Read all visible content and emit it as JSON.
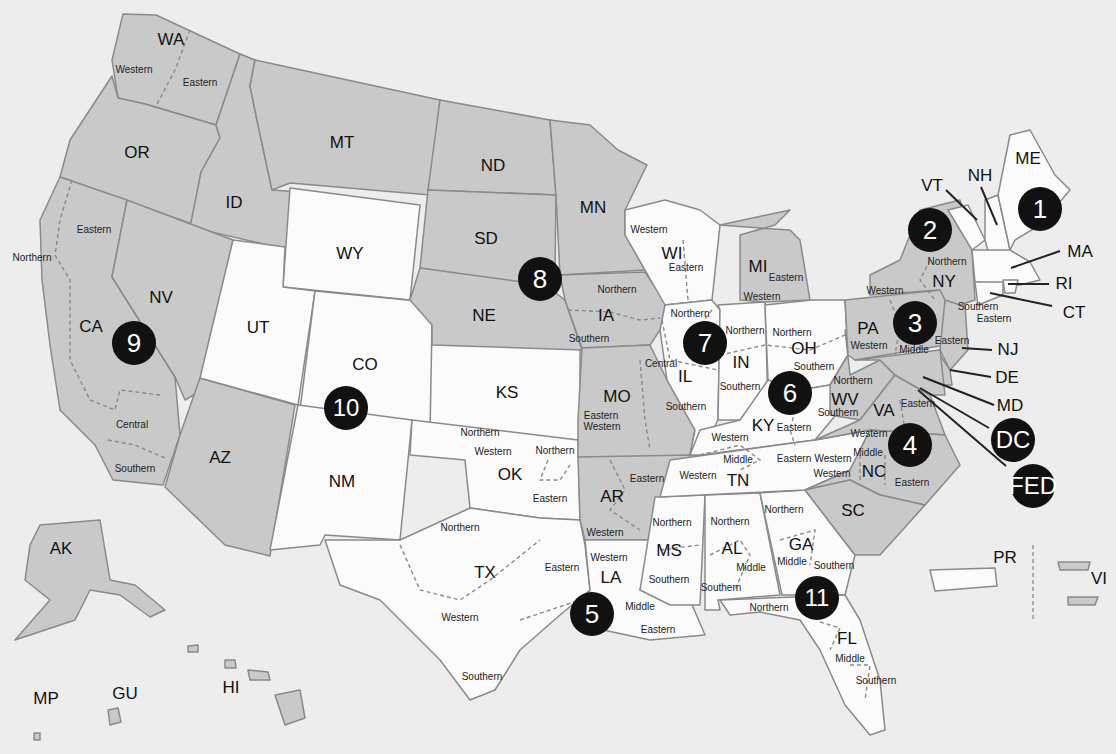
{
  "map": {
    "type": "US federal judicial circuits and districts",
    "colors": {
      "background": "#ededed",
      "gray_circuit": "#c9c9c9",
      "white_circuit": "#fbfbfb",
      "badge": "#111111",
      "border": "#8a8a8a"
    }
  },
  "states": [
    {
      "abbr": "WA",
      "x": 171,
      "y": 40
    },
    {
      "abbr": "OR",
      "x": 137,
      "y": 153
    },
    {
      "abbr": "ID",
      "x": 234,
      "y": 203
    },
    {
      "abbr": "MT",
      "x": 342,
      "y": 143
    },
    {
      "abbr": "WY",
      "x": 350,
      "y": 254
    },
    {
      "abbr": "NV",
      "x": 161,
      "y": 298
    },
    {
      "abbr": "CA",
      "x": 91,
      "y": 327
    },
    {
      "abbr": "UT",
      "x": 258,
      "y": 328
    },
    {
      "abbr": "CO",
      "x": 365,
      "y": 365
    },
    {
      "abbr": "AZ",
      "x": 220,
      "y": 458
    },
    {
      "abbr": "NM",
      "x": 342,
      "y": 482
    },
    {
      "abbr": "ND",
      "x": 493,
      "y": 166
    },
    {
      "abbr": "SD",
      "x": 486,
      "y": 239
    },
    {
      "abbr": "NE",
      "x": 484,
      "y": 316
    },
    {
      "abbr": "MN",
      "x": 593,
      "y": 208
    },
    {
      "abbr": "KS",
      "x": 507,
      "y": 393
    },
    {
      "abbr": "OK",
      "x": 510,
      "y": 475
    },
    {
      "abbr": "TX",
      "x": 485,
      "y": 573
    },
    {
      "abbr": "IA",
      "x": 606,
      "y": 316
    },
    {
      "abbr": "MO",
      "x": 617,
      "y": 397
    },
    {
      "abbr": "AR",
      "x": 612,
      "y": 497
    },
    {
      "abbr": "LA",
      "x": 611,
      "y": 578
    },
    {
      "abbr": "WI",
      "x": 672,
      "y": 254
    },
    {
      "abbr": "MI",
      "x": 758,
      "y": 267
    },
    {
      "abbr": "IL",
      "x": 685,
      "y": 377
    },
    {
      "abbr": "IN",
      "x": 741,
      "y": 363
    },
    {
      "abbr": "OH",
      "x": 804,
      "y": 349
    },
    {
      "abbr": "KY",
      "x": 763,
      "y": 426
    },
    {
      "abbr": "TN",
      "x": 738,
      "y": 481
    },
    {
      "abbr": "MS",
      "x": 669,
      "y": 551
    },
    {
      "abbr": "AL",
      "x": 732,
      "y": 549
    },
    {
      "abbr": "GA",
      "x": 801,
      "y": 545
    },
    {
      "abbr": "FL",
      "x": 847,
      "y": 639
    },
    {
      "abbr": "SC",
      "x": 853,
      "y": 511
    },
    {
      "abbr": "NC",
      "x": 874,
      "y": 472
    },
    {
      "abbr": "VA",
      "x": 884,
      "y": 411
    },
    {
      "abbr": "WV",
      "x": 845,
      "y": 400
    },
    {
      "abbr": "PA",
      "x": 868,
      "y": 329
    },
    {
      "abbr": "NY",
      "x": 944,
      "y": 282
    },
    {
      "abbr": "ME",
      "x": 1028,
      "y": 159
    },
    {
      "abbr": "VT",
      "x": 932,
      "y": 186
    },
    {
      "abbr": "NH",
      "x": 980,
      "y": 176
    },
    {
      "abbr": "MA",
      "x": 1080,
      "y": 252
    },
    {
      "abbr": "RI",
      "x": 1064,
      "y": 284
    },
    {
      "abbr": "CT",
      "x": 1074,
      "y": 313
    },
    {
      "abbr": "NJ",
      "x": 1008,
      "y": 350
    },
    {
      "abbr": "DE",
      "x": 1007,
      "y": 378
    },
    {
      "abbr": "MD",
      "x": 1010,
      "y": 406
    },
    {
      "abbr": "AK",
      "x": 61,
      "y": 549
    },
    {
      "abbr": "HI",
      "x": 231,
      "y": 688
    },
    {
      "abbr": "GU",
      "x": 125,
      "y": 694
    },
    {
      "abbr": "MP",
      "x": 46,
      "y": 699
    },
    {
      "abbr": "PR",
      "x": 1005,
      "y": 558
    },
    {
      "abbr": "VI",
      "x": 1099,
      "y": 579
    }
  ],
  "districts": [
    {
      "name": "Western",
      "x": 134,
      "y": 69
    },
    {
      "name": "Eastern",
      "x": 200,
      "y": 82
    },
    {
      "name": "Eastern",
      "x": 94,
      "y": 229
    },
    {
      "name": "Northern",
      "x": 32,
      "y": 257
    },
    {
      "name": "Central",
      "x": 132,
      "y": 424
    },
    {
      "name": "Southern",
      "x": 135,
      "y": 468
    },
    {
      "name": "Northern",
      "x": 617,
      "y": 289
    },
    {
      "name": "Southern",
      "x": 589,
      "y": 338
    },
    {
      "name": "Western",
      "x": 649,
      "y": 229
    },
    {
      "name": "Eastern",
      "x": 686,
      "y": 267
    },
    {
      "name": "Eastern",
      "x": 786,
      "y": 277
    },
    {
      "name": "Western",
      "x": 762,
      "y": 296
    },
    {
      "name": "Northern",
      "x": 690,
      "y": 313
    },
    {
      "name": "Central",
      "x": 661,
      "y": 363
    },
    {
      "name": "Southern",
      "x": 686,
      "y": 406
    },
    {
      "name": "Northern",
      "x": 745,
      "y": 330
    },
    {
      "name": "Southern",
      "x": 740,
      "y": 386
    },
    {
      "name": "Northern",
      "x": 792,
      "y": 332
    },
    {
      "name": "Southern",
      "x": 814,
      "y": 366
    },
    {
      "name": "Eastern",
      "x": 601,
      "y": 415
    },
    {
      "name": "Western",
      "x": 602,
      "y": 426
    },
    {
      "name": "Western",
      "x": 730,
      "y": 437
    },
    {
      "name": "Eastern",
      "x": 794,
      "y": 427
    },
    {
      "name": "Middle",
      "x": 738,
      "y": 459
    },
    {
      "name": "Eastern",
      "x": 794,
      "y": 458
    },
    {
      "name": "Western",
      "x": 698,
      "y": 475
    },
    {
      "name": "Western",
      "x": 833,
      "y": 458
    },
    {
      "name": "Northern",
      "x": 853,
      "y": 380
    },
    {
      "name": "Southern",
      "x": 838,
      "y": 412
    },
    {
      "name": "Eastern",
      "x": 918,
      "y": 403
    },
    {
      "name": "Western",
      "x": 869,
      "y": 433
    },
    {
      "name": "Middle",
      "x": 868,
      "y": 452
    },
    {
      "name": "Western",
      "x": 832,
      "y": 473
    },
    {
      "name": "Eastern",
      "x": 912,
      "y": 482
    },
    {
      "name": "Western",
      "x": 869,
      "y": 345
    },
    {
      "name": "Middle",
      "x": 914,
      "y": 349
    },
    {
      "name": "Eastern",
      "x": 952,
      "y": 340
    },
    {
      "name": "Northern",
      "x": 947,
      "y": 261
    },
    {
      "name": "Western",
      "x": 885,
      "y": 290
    },
    {
      "name": "Southern",
      "x": 978,
      "y": 306
    },
    {
      "name": "Eastern",
      "x": 994,
      "y": 318
    },
    {
      "name": "Western",
      "x": 493,
      "y": 451
    },
    {
      "name": "Northern",
      "x": 555,
      "y": 450
    },
    {
      "name": "Eastern",
      "x": 550,
      "y": 498
    },
    {
      "name": "Eastern",
      "x": 647,
      "y": 478
    },
    {
      "name": "Western",
      "x": 605,
      "y": 532
    },
    {
      "name": "Northern",
      "x": 460,
      "y": 527
    },
    {
      "name": "Eastern",
      "x": 562,
      "y": 567
    },
    {
      "name": "Western",
      "x": 460,
      "y": 617
    },
    {
      "name": "Southern",
      "x": 482,
      "y": 676
    },
    {
      "name": "Western",
      "x": 609,
      "y": 557
    },
    {
      "name": "Middle",
      "x": 640,
      "y": 606
    },
    {
      "name": "Eastern",
      "x": 658,
      "y": 629
    },
    {
      "name": "Northern",
      "x": 672,
      "y": 522
    },
    {
      "name": "Southern",
      "x": 669,
      "y": 579
    },
    {
      "name": "Northern",
      "x": 730,
      "y": 521
    },
    {
      "name": "Middle",
      "x": 751,
      "y": 567
    },
    {
      "name": "Southern",
      "x": 721,
      "y": 587
    },
    {
      "name": "Northern",
      "x": 784,
      "y": 509
    },
    {
      "name": "Middle",
      "x": 792,
      "y": 561
    },
    {
      "name": "Southern",
      "x": 834,
      "y": 565
    },
    {
      "name": "Northern",
      "x": 769,
      "y": 607
    },
    {
      "name": "Middle",
      "x": 850,
      "y": 658
    },
    {
      "name": "Southern",
      "x": 876,
      "y": 680
    },
    {
      "name": "Northern",
      "x": 480,
      "y": 432
    }
  ],
  "circuits": [
    {
      "label": "1",
      "x": 1040,
      "y": 209
    },
    {
      "label": "2",
      "x": 930,
      "y": 230
    },
    {
      "label": "3",
      "x": 915,
      "y": 323
    },
    {
      "label": "4",
      "x": 910,
      "y": 445
    },
    {
      "label": "5",
      "x": 592,
      "y": 614
    },
    {
      "label": "6",
      "x": 790,
      "y": 393
    },
    {
      "label": "7",
      "x": 705,
      "y": 343
    },
    {
      "label": "8",
      "x": 540,
      "y": 279
    },
    {
      "label": "9",
      "x": 134,
      "y": 343
    },
    {
      "label": "10",
      "x": 346,
      "y": 408
    },
    {
      "label": "11",
      "x": 817,
      "y": 598
    },
    {
      "label": "DC",
      "x": 1013,
      "y": 440
    },
    {
      "label": "FED",
      "x": 1033,
      "y": 486
    }
  ]
}
